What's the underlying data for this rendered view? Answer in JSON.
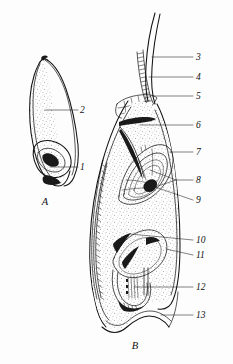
{
  "figure": {
    "background_color": "#fdfdfd",
    "ink_color": "#111111",
    "stipple_color": "#6f6f6f",
    "panels": [
      {
        "letter": "A",
        "name": "whole-seed-external-view",
        "callouts": [
          "1",
          "2"
        ]
      },
      {
        "letter": "B",
        "name": "seed-longitudinal-section",
        "callouts": [
          "3",
          "4",
          "5",
          "6",
          "7",
          "8",
          "9",
          "10",
          "11",
          "12",
          "13"
        ]
      }
    ],
    "panel_letters": {
      "a": "A",
      "b": "B"
    },
    "callouts": [
      {
        "id": "1",
        "label": "1",
        "panel": "A",
        "text_x": 80,
        "text_y": 170
      },
      {
        "id": "2",
        "label": "2",
        "panel": "A",
        "text_x": 80,
        "text_y": 113
      },
      {
        "id": "3",
        "label": "3",
        "panel": "B",
        "text_x": 196,
        "text_y": 60
      },
      {
        "id": "4",
        "label": "4",
        "panel": "B",
        "text_x": 196,
        "text_y": 80
      },
      {
        "id": "5",
        "label": "5",
        "panel": "B",
        "text_x": 196,
        "text_y": 99
      },
      {
        "id": "6",
        "label": "6",
        "panel": "B",
        "text_x": 196,
        "text_y": 128
      },
      {
        "id": "7",
        "label": "7",
        "panel": "B",
        "text_x": 196,
        "text_y": 155
      },
      {
        "id": "8",
        "label": "8",
        "panel": "B",
        "text_x": 196,
        "text_y": 183
      },
      {
        "id": "9",
        "label": "9",
        "panel": "B",
        "text_x": 196,
        "text_y": 203
      },
      {
        "id": "10",
        "label": "10",
        "panel": "B",
        "text_x": 196,
        "text_y": 243
      },
      {
        "id": "11",
        "label": "11",
        "panel": "B",
        "text_x": 196,
        "text_y": 258
      },
      {
        "id": "12",
        "label": "12",
        "panel": "B",
        "text_x": 196,
        "text_y": 290
      },
      {
        "id": "13",
        "label": "13",
        "panel": "B",
        "text_x": 196,
        "text_y": 318
      }
    ]
  }
}
